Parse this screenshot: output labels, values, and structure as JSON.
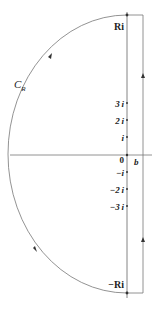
{
  "diagram": {
    "type": "contour-integral",
    "contour_label": "C",
    "contour_subscript": "R",
    "labels": {
      "top": "Ri",
      "bottom": "−Ri",
      "origin": "0",
      "b": "b",
      "ticks_upper": [
        "3 i",
        "2 i",
        "i"
      ],
      "ticks_lower": [
        "−i",
        "−2 i",
        "−3 i"
      ]
    },
    "colors": {
      "line": "#555555",
      "text": "#222222"
    }
  }
}
